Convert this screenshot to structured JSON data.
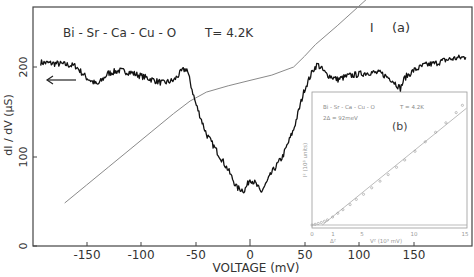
{
  "chart_data": [
    {
      "panel": "(a)",
      "type": "line",
      "title": "",
      "annotations": [
        "Bi-Sr-Ca-Cu-O",
        "T=4.2K",
        "I",
        "(a)"
      ],
      "xlabel": "VOLTAGE (mV)",
      "ylabel": "dI / dV (µS)",
      "xlim": [
        -200,
        204
      ],
      "ylim": [
        0,
        200
      ],
      "x_ticks": [
        -150,
        -100,
        -50,
        0,
        50,
        100,
        150
      ],
      "y_ticks": [
        0,
        100,
        200
      ],
      "grid": false,
      "arrow_annotation": "left-pointing arrow indicating dI/dV curve uses left axis",
      "series": [
        {
          "name": "dI/dV",
          "style": "noisy black trace",
          "x": [
            -192,
            -180,
            -170,
            -160,
            -150,
            -140,
            -130,
            -120,
            -110,
            -100,
            -90,
            -80,
            -70,
            -62,
            -58,
            -50,
            -40,
            -30,
            -20,
            -12,
            -5,
            0,
            5,
            10,
            15,
            20,
            30,
            40,
            50,
            58,
            62,
            70,
            80,
            90,
            100,
            110,
            120,
            130,
            138,
            142,
            150,
            160,
            170,
            180,
            190,
            198
          ],
          "values": [
            205,
            204,
            203,
            201,
            188,
            180,
            193,
            196,
            194,
            190,
            186,
            182,
            185,
            196,
            198,
            160,
            125,
            105,
            85,
            65,
            62,
            75,
            70,
            60,
            70,
            82,
            100,
            130,
            175,
            197,
            203,
            192,
            186,
            190,
            192,
            194,
            193,
            186,
            176,
            188,
            196,
            202,
            204,
            208,
            210,
            211
          ]
        },
        {
          "name": "I (current, arbitrary units)",
          "style": "thin gray line",
          "x": [
            -170,
            -150,
            -130,
            -110,
            -90,
            -70,
            -55,
            -40,
            -20,
            0,
            20,
            40,
            50,
            60,
            80,
            100,
            120,
            140,
            160,
            172
          ],
          "values": [
            48,
            68,
            88,
            108,
            128,
            148,
            162,
            172,
            179,
            185,
            191,
            200,
            212,
            225,
            246,
            268,
            290,
            312,
            334,
            347
          ]
        }
      ]
    },
    {
      "panel": "(b)",
      "type": "scatter",
      "title": "",
      "annotations": [
        "Bi-Sr-Ca-Cu-O",
        "T=4.2K",
        "2Δ = 92meV",
        "(b)",
        "Δ²"
      ],
      "xlabel": "V² (10³ mV)",
      "ylabel": "I² (10³ units)",
      "xlim": [
        0,
        15
      ],
      "x_ticks": [
        0,
        1,
        5,
        10,
        15
      ],
      "x_tick_labels": [
        "0",
        "1",
        "5",
        "10",
        "15"
      ],
      "grid": false,
      "series": [
        {
          "name": "measured points",
          "x": [
            0,
            0.3,
            0.6,
            0.9,
            1.2,
            1.5,
            2.0,
            2.5,
            3.0,
            3.7,
            4.3,
            5.0,
            5.8,
            6.6,
            7.4,
            8.2,
            9.0,
            10.0,
            11.0,
            12.0,
            13.0,
            14.0,
            14.6
          ],
          "values": [
            0,
            0.05,
            0.1,
            0.17,
            0.25,
            0.35,
            0.55,
            0.8,
            1.05,
            1.4,
            1.75,
            2.1,
            2.55,
            3.0,
            3.45,
            3.95,
            4.45,
            5.05,
            5.7,
            6.35,
            7.0,
            7.7,
            8.2
          ]
        },
        {
          "name": "linear fit",
          "x": [
            1,
            15
          ],
          "values": [
            0,
            8.0
          ]
        }
      ]
    }
  ],
  "text": {
    "sample": "Bi - Sr - Ca - Cu - O",
    "temperature": "T= 4.2K",
    "current_label": "I",
    "panel_a": "(a)",
    "panel_b": "(b)",
    "xlabel": "VOLTAGE  (mV)",
    "ylabel": "dI / dV (µS)",
    "inset_sample": "Bi - Sr - Ca - Cu - O",
    "inset_temperature": "T = 4.2K",
    "inset_gap": "2Δ = 92meV",
    "inset_xlabel": "V²  (10³ mV)",
    "inset_ylabel": "I² (10³ units)",
    "inset_delta_label": "Δ²",
    "x_ticks": [
      "-150",
      "-100",
      "-50",
      "0",
      "50",
      "100",
      "150"
    ],
    "y_ticks": [
      "0",
      "100",
      "200"
    ],
    "inset_x_ticks": [
      "0",
      "1",
      "5",
      "10",
      "15"
    ]
  },
  "colors": {
    "trace": "#111111",
    "iv_curve": "#8a8a8a",
    "axes": "#444444",
    "inset": "#9a9a9a",
    "text": "#333333"
  }
}
